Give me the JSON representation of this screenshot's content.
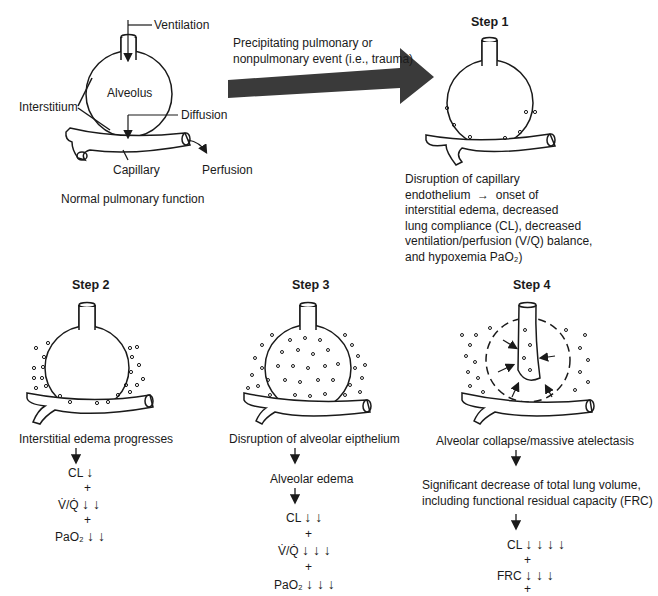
{
  "normal": {
    "caption": "Normal pulmonary function",
    "labels": {
      "ventilation": "Ventilation",
      "alveolus": "Alveolus",
      "interstitium": "Interstitium",
      "diffusion": "Diffusion",
      "capillary": "Capillary",
      "perfusion": "Perfusion"
    }
  },
  "event": {
    "line1": "Precipitating pulmonary or",
    "line2": "nonpulmonary event (i.e., trauma)"
  },
  "step1": {
    "title": "Step 1",
    "lines": [
      "Disruption of capillary",
      "endothelium  →  onset of",
      "interstitial edema, decreased",
      "lung compliance (CL), decreased",
      "ventilation/perfusion (V/Q) balance,",
      "and hypoxemia PaO₂)"
    ]
  },
  "step2": {
    "title": "Step 2",
    "caption": "Interstitial edema progresses",
    "effects": [
      {
        "label": "CL",
        "arrows": "↓"
      },
      {
        "label": "V̇/Q̇",
        "arrows": "↓ ↓"
      },
      {
        "label": "PaO₂",
        "arrows": "↓ ↓"
      }
    ],
    "plus": "+"
  },
  "step3": {
    "title": "Step 3",
    "caption": "Disruption of alveolar eipthelium",
    "sub": "Alveolar edema",
    "effects": [
      {
        "label": "CL",
        "arrows": "↓ ↓"
      },
      {
        "label": "V̇/Q̇",
        "arrows": "↓ ↓ ↓"
      },
      {
        "label": "PaO₂",
        "arrows": "↓ ↓ ↓"
      }
    ],
    "plus": "+"
  },
  "step4": {
    "title": "Step 4",
    "caption": "Alveolar collapse/massive atelectasis",
    "sub1": "Significant decrease of total lung volume,",
    "sub2": "including functional residual capacity (FRC)",
    "effects": [
      {
        "label": "CL",
        "arrows": "↓ ↓ ↓ ↓"
      },
      {
        "label": "FRC",
        "arrows": "↓ ↓ ↓"
      }
    ],
    "plus": "+"
  },
  "colors": {
    "ink": "#1a1a1a",
    "arrow_fill": "#3a3a3a"
  }
}
